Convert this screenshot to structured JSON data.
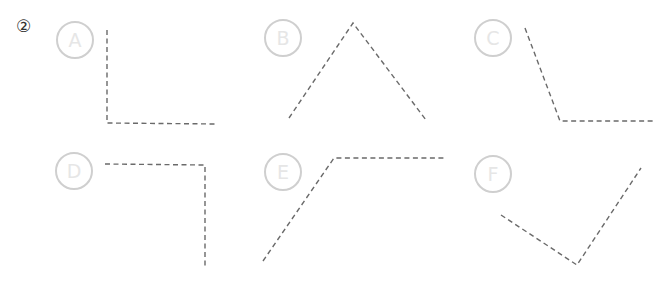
{
  "question_number": "②",
  "colors": {
    "circle_border": "#cfcfcf",
    "circle_letter": "#e6e6e6",
    "dashed_line": "#6a6a6a",
    "background": "#ffffff"
  },
  "items": [
    {
      "label": "A",
      "circle": {
        "cx": 75,
        "cy": 40
      },
      "points": "107,30 107,123 217,124"
    },
    {
      "label": "B",
      "circle": {
        "cx": 283,
        "cy": 38
      },
      "points": "289,118 353,23 426,120"
    },
    {
      "label": "C",
      "circle": {
        "cx": 493,
        "cy": 38
      },
      "points": "525,28 560,121 655,121"
    },
    {
      "label": "D",
      "circle": {
        "cx": 74,
        "cy": 171
      },
      "points": "105,164 205,165 205,268"
    },
    {
      "label": "E",
      "circle": {
        "cx": 283,
        "cy": 172
      },
      "points": "263,261 334,158 444,158"
    },
    {
      "label": "F",
      "circle": {
        "cx": 493,
        "cy": 174
      },
      "points": "501,215 577,265 641,168"
    }
  ]
}
